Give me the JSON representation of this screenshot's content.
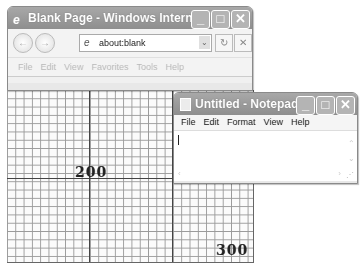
{
  "colors": {
    "titlebar": "#989898",
    "grid_line": "#9a9a9a",
    "grid_major": "#444444",
    "background": "#ffffff"
  },
  "ie_window": {
    "title": "Blank Page - Windows Intern...",
    "icon": "ie-logo-icon",
    "controls": {
      "minimize": "_",
      "maximize": "□",
      "close": "✕"
    },
    "nav": {
      "back": "←",
      "forward": "→",
      "refresh": "↻",
      "stop": "✕"
    },
    "address": {
      "value": "about:blank",
      "dropdown": "⌄"
    },
    "menu": [
      "File",
      "Edit",
      "View",
      "Favorites",
      "Tools",
      "Help"
    ]
  },
  "grid": {
    "labels": [
      {
        "text": "200"
      },
      {
        "text": "300"
      }
    ]
  },
  "notepad_window": {
    "title": "Untitled - Notepad",
    "icon": "notepad-icon",
    "controls": {
      "minimize": "_",
      "maximize": "□",
      "close": "✕"
    },
    "menu": [
      "File",
      "Edit",
      "Format",
      "View",
      "Help"
    ],
    "content": "",
    "scroll": {
      "up": "⌃",
      "down": "⌄",
      "left": "‹",
      "right": "›",
      "grip": "⋰"
    }
  }
}
